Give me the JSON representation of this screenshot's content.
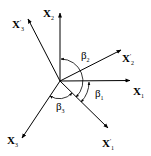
{
  "diagram": {
    "type": "coordinate-axes-rotation",
    "origin": [
      60,
      81
    ],
    "axes": [
      {
        "id": "x1",
        "symbol": "X",
        "subscript": "1",
        "primed": false,
        "tip": [
          130,
          80
        ]
      },
      {
        "id": "x2",
        "symbol": "X",
        "subscript": "2",
        "primed": false,
        "tip": [
          60,
          13
        ]
      },
      {
        "id": "x3",
        "symbol": "X",
        "subscript": "3",
        "primed": false,
        "tip": [
          22,
          138
        ]
      },
      {
        "id": "x1p",
        "symbol": "X",
        "subscript": "1",
        "primed": true,
        "tip": [
          108,
          128
        ]
      },
      {
        "id": "x2p",
        "symbol": "X",
        "subscript": "2",
        "primed": true,
        "tip": [
          121,
          50
        ]
      },
      {
        "id": "x3p",
        "symbol": "X",
        "subscript": "3",
        "primed": true,
        "tip": [
          28,
          19
        ]
      }
    ],
    "labels": {
      "x1": {
        "main": "X",
        "sub": "1"
      },
      "x2": {
        "main": "X",
        "sub": "2"
      },
      "x3": {
        "main": "X",
        "sub": "3"
      },
      "x1p": {
        "main": "X",
        "prime": "'",
        "sub": "1"
      },
      "x2p": {
        "main": "X",
        "prime": "'",
        "sub": "2"
      },
      "x3p": {
        "main": "X",
        "prime": "'",
        "sub": "3"
      }
    },
    "angles": [
      {
        "id": "beta1",
        "symbol": "β",
        "subscript": "1",
        "from": "x1",
        "to": "x1p"
      },
      {
        "id": "beta2",
        "symbol": "β",
        "subscript": "2",
        "from": "x2",
        "to": "x1p"
      },
      {
        "id": "beta3",
        "symbol": "β",
        "subscript": "3",
        "from": "x3",
        "to": "x1p"
      }
    ],
    "angle_labels": {
      "beta1": {
        "main": "β",
        "sub": "1"
      },
      "beta2": {
        "main": "β",
        "sub": "2"
      },
      "beta3": {
        "main": "β",
        "sub": "3"
      }
    },
    "colors": {
      "stroke": "#000000",
      "background": "#ffffff"
    }
  }
}
